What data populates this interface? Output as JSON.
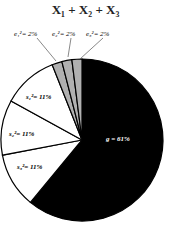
{
  "chart_data": {
    "type": "pie",
    "slices": [
      {
        "label": "g = 61%",
        "value": 61,
        "color": "#000000"
      },
      {
        "label": "s1² = 11%",
        "value": 11,
        "color": "#ffffff"
      },
      {
        "label": "s2² = 11%",
        "value": 11,
        "color": "#ffffff"
      },
      {
        "label": "s3² = 11%",
        "value": 11,
        "color": "#ffffff"
      },
      {
        "label": "e1² = 2%",
        "value": 2,
        "color": "#b0b0b0"
      },
      {
        "label": "e2² = 2%",
        "value": 2,
        "color": "#b0b0b0"
      },
      {
        "label": "e3² = 2%",
        "value": 2,
        "color": "#b0b0b0"
      }
    ]
  },
  "title_text": "X₁ + X₂ + X₃",
  "labels": {
    "g": "g = 61%",
    "s1": "s₁²= 11%",
    "s2": "s₂²= 11%",
    "s3": "s₃²= 11%",
    "e1": "e₁²= 2%",
    "e2": "e₂²= 2%",
    "e3": "e₃²= 2%"
  }
}
